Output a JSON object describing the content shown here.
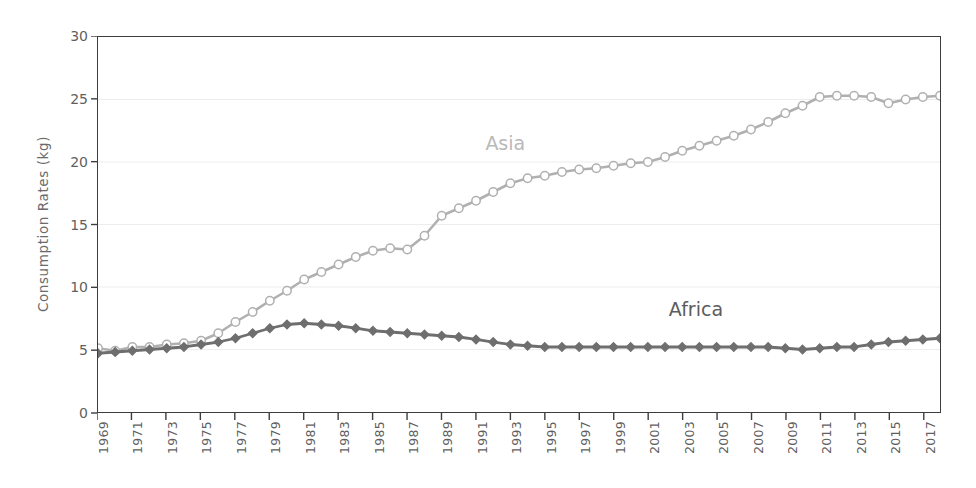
{
  "chart_data": {
    "type": "line",
    "title": "",
    "xlabel": "",
    "ylabel": "Consumption Rates (kg)",
    "ylim": [
      0,
      30
    ],
    "yticks": [
      0,
      5,
      10,
      15,
      20,
      25,
      30
    ],
    "xlim": [
      1969,
      2018
    ],
    "xticks": [
      1969,
      1971,
      1973,
      1975,
      1977,
      1979,
      1981,
      1983,
      1985,
      1987,
      1989,
      1991,
      1993,
      1995,
      1997,
      1999,
      2001,
      2003,
      2005,
      2007,
      2009,
      2011,
      2013,
      2015,
      2017
    ],
    "xtick_labels": [
      "1969",
      "1971",
      "1973",
      "1975",
      "1977",
      "1979",
      "1981",
      "1983",
      "1985",
      "1987",
      "1989",
      "1991",
      "1993",
      "1995",
      "1997",
      "1999",
      "2001",
      "2003",
      "2005",
      "2007",
      "2009",
      "2011",
      "2013",
      "2015",
      "2017"
    ],
    "grid": true,
    "grid_axis": "y",
    "legend_position": "inline-annotation",
    "x": [
      1969,
      1970,
      1971,
      1972,
      1973,
      1974,
      1975,
      1976,
      1977,
      1978,
      1979,
      1980,
      1981,
      1982,
      1983,
      1984,
      1985,
      1986,
      1987,
      1988,
      1989,
      1990,
      1991,
      1992,
      1993,
      1994,
      1995,
      1996,
      1997,
      1998,
      1999,
      2000,
      2001,
      2002,
      2003,
      2004,
      2005,
      2006,
      2007,
      2008,
      2009,
      2010,
      2011,
      2012,
      2013,
      2014,
      2015,
      2016,
      2017,
      2018
    ],
    "series": [
      {
        "name": "Asia",
        "color": "#ffffff",
        "line_color": "#b0b0b0",
        "marker": "open-circle",
        "values": [
          5.1,
          4.9,
          5.2,
          5.2,
          5.4,
          5.5,
          5.7,
          6.3,
          7.2,
          8.0,
          8.9,
          9.7,
          10.6,
          11.2,
          11.8,
          12.4,
          12.9,
          13.1,
          13.0,
          14.1,
          15.7,
          16.3,
          16.9,
          17.6,
          18.3,
          18.7,
          18.9,
          19.2,
          19.4,
          19.5,
          19.7,
          19.9,
          20.0,
          20.4,
          20.9,
          21.3,
          21.7,
          22.1,
          22.6,
          23.2,
          23.9,
          24.5,
          25.2,
          25.3,
          25.3,
          25.2,
          24.7,
          25.0,
          25.2,
          25.3
        ]
      },
      {
        "name": "Africa",
        "color": "#6e6e6e",
        "line_color": "#6e6e6e",
        "marker": "filled-diamond",
        "values": [
          4.7,
          4.8,
          4.9,
          5.0,
          5.1,
          5.2,
          5.4,
          5.6,
          5.9,
          6.3,
          6.7,
          7.0,
          7.1,
          7.0,
          6.9,
          6.7,
          6.5,
          6.4,
          6.3,
          6.2,
          6.1,
          6.0,
          5.8,
          5.6,
          5.4,
          5.3,
          5.2,
          5.2,
          5.2,
          5.2,
          5.2,
          5.2,
          5.2,
          5.2,
          5.2,
          5.2,
          5.2,
          5.2,
          5.2,
          5.2,
          5.1,
          5.0,
          5.1,
          5.2,
          5.2,
          5.4,
          5.6,
          5.7,
          5.8,
          5.9
        ]
      }
    ],
    "annotations": [
      {
        "text": "Asia",
        "x": 1993,
        "y": 21.5
      },
      {
        "text": "Africa",
        "x": 2004,
        "y": 8.3
      }
    ]
  },
  "axis": {
    "y_title": "Consumption Rates (kg)"
  },
  "colors": {
    "asia_line": "#b0b0b0",
    "asia_marker_fill": "#ffffff",
    "africa_line": "#6e6e6e",
    "africa_marker_fill": "#6e6e6e",
    "frame": "#3d3d3d",
    "gridline": "#ededed",
    "tick_text": "#5f5f5f",
    "background": "#ffffff"
  }
}
